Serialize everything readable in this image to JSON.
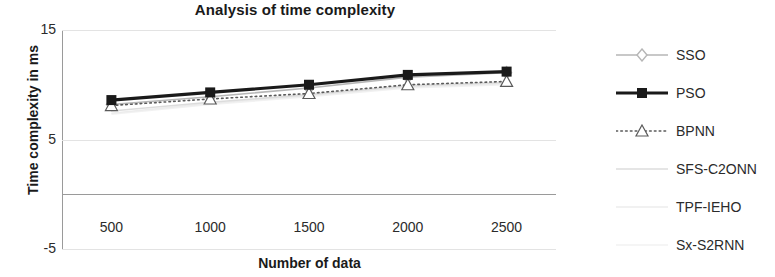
{
  "chart_data": {
    "type": "line",
    "title": "Analysis of time complexity",
    "xlabel": "Number of data",
    "ylabel": "Time complexity in ms",
    "categories": [
      "500",
      "1000",
      "1500",
      "2000",
      "2500"
    ],
    "x_tick_labels": [
      "500",
      "1000",
      "1500",
      "2000",
      "2500"
    ],
    "y_tick_labels": [
      "15",
      "5",
      "-5"
    ],
    "y_tick_values": [
      15,
      5,
      -5
    ],
    "ylim": [
      -5,
      15
    ],
    "grid": true,
    "legend_position": "right",
    "series": [
      {
        "name": "SSO",
        "marker": "diamond",
        "line_style": "solid",
        "color": "#b6b6b6",
        "values": [
          8.2,
          8.9,
          9.7,
          10.7,
          11.1
        ]
      },
      {
        "name": "PSO",
        "marker": "square",
        "line_style": "solid",
        "color": "#1a1a1a",
        "values": [
          8.6,
          9.3,
          10.0,
          10.9,
          11.2
        ]
      },
      {
        "name": "BPNN",
        "marker": "triangle",
        "line_style": "dotted",
        "color": "#5a5a5a",
        "values": [
          8.1,
          8.7,
          9.2,
          10.0,
          10.3
        ]
      },
      {
        "name": "SFS-C2ONN",
        "marker": "line",
        "line_style": "solid",
        "color": "#dcdcdc",
        "values": [
          7.6,
          8.4,
          9.1,
          9.9,
          10.2
        ]
      },
      {
        "name": "TPF-IEHO",
        "marker": "none",
        "line_style": "solid",
        "color": "#ececec",
        "values": [
          7.4,
          8.3,
          9.0,
          9.8,
          10.1
        ]
      },
      {
        "name": "Sx-S2RNN",
        "marker": "none",
        "line_style": "solid",
        "color": "#f2f2f2",
        "values": [
          7.3,
          8.2,
          8.9,
          9.7,
          10.0
        ]
      }
    ]
  }
}
